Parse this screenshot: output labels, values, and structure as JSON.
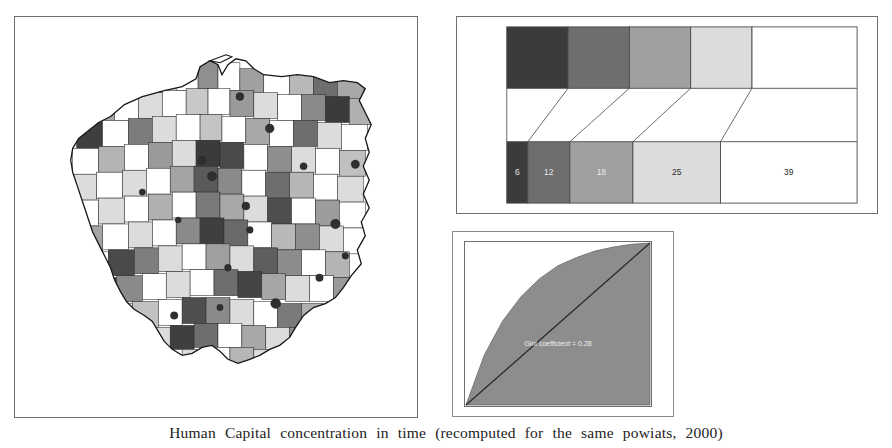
{
  "figure": {
    "caption": "Human Capital concentration in time (recomputed for the same powiats, 2000)"
  },
  "map": {
    "title": "Poland powiats choropleth",
    "region_name": "Poland",
    "unit": "powiat",
    "classes": 5
  },
  "legend": {
    "title": "",
    "top_row_label": "class shades",
    "bottom_row_label": "class counts",
    "classes": [
      {
        "index": 0,
        "color": "#3b3b3b",
        "count_label": "6",
        "count": 6,
        "top_width": 17.5,
        "bottom_width": 6.0
      },
      {
        "index": 1,
        "color": "#6e6e6e",
        "count_label": "12",
        "count": 12,
        "top_width": 17.5,
        "bottom_width": 12.0
      },
      {
        "index": 2,
        "color": "#a0a0a0",
        "count_label": "18",
        "count": 18,
        "top_width": 17.5,
        "bottom_width": 18.0
      },
      {
        "index": 3,
        "color": "#dcdcdc",
        "count_label": "25",
        "count": 25,
        "top_width": 17.5,
        "bottom_width": 25.0
      },
      {
        "index": 4,
        "color": "#ffffff",
        "count_label": "39",
        "count": 39,
        "top_width": 30.0,
        "bottom_width": 39.0
      }
    ]
  },
  "lorenz": {
    "inline_label": "Gini coefficient = 0.28",
    "fill_color": "#8d8d8d",
    "diagonal_color": "#2a2a2a",
    "axis_color": "#6f6f6f"
  },
  "chart_data": [
    {
      "type": "bar",
      "id": "legend-class-counts",
      "title": "Number of powiats per Human Capital class",
      "categories": [
        "class 1 (darkest)",
        "class 2",
        "class 3",
        "class 4",
        "class 5 (white)"
      ],
      "values": [
        6,
        12,
        18,
        25,
        39
      ],
      "value_labels": [
        "6",
        "12",
        "18",
        "25",
        "39"
      ],
      "colors": [
        "#3b3b3b",
        "#6e6e6e",
        "#a0a0a0",
        "#dcdcdc",
        "#ffffff"
      ],
      "xlabel": "",
      "ylabel": "count of powiats",
      "orientation": "horizontal-stacked",
      "grid": false,
      "legend": "none",
      "note": "Top row shows the five equal-width class swatches; bottom row shows the same classes with widths proportional to the number of powiats in each class; connector lines join matching classes."
    },
    {
      "type": "line",
      "id": "lorenz-curve",
      "title": "Lorenz curve of Human Capital concentration",
      "xlabel": "cumulative share of powiats",
      "ylabel": "cumulative share of Human Capital",
      "xlim": [
        0,
        1
      ],
      "ylim": [
        0,
        1
      ],
      "grid": false,
      "legend": "none",
      "annotations": [
        "Gini coefficient = 0.28"
      ],
      "series": [
        {
          "name": "Lorenz curve",
          "x": [
            0,
            0.1,
            0.2,
            0.3,
            0.4,
            0.5,
            0.6,
            0.7,
            0.8,
            0.9,
            1.0
          ],
          "y": [
            0,
            0.31,
            0.52,
            0.67,
            0.78,
            0.86,
            0.91,
            0.95,
            0.975,
            0.992,
            1.0
          ]
        },
        {
          "name": "line of equality",
          "x": [
            0,
            1
          ],
          "y": [
            0,
            1
          ]
        }
      ]
    }
  ]
}
